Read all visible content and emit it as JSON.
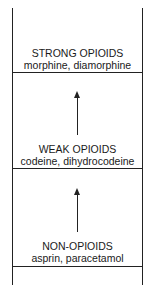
{
  "ladder": {
    "steps": [
      {
        "title": "STRONG OPIOIDS",
        "examples": "morphine, diamorphine"
      },
      {
        "title": "WEAK OPIOIDS",
        "examples": "codeine, dihydrocodeine"
      },
      {
        "title": "NON-OPIOIDS",
        "examples": "asprin, paracetamol"
      }
    ],
    "arrow_direction": "up"
  }
}
